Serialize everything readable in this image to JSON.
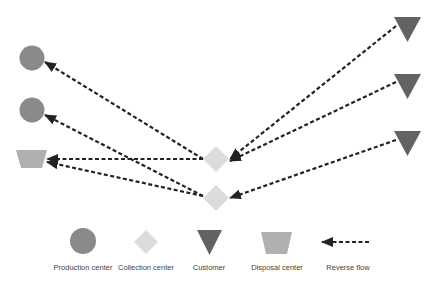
{
  "colors": {
    "production": "#8a8a8a",
    "collection": "#dcdcdc",
    "customer": "#636363",
    "disposal": "#b0b0b0",
    "flow": "#222222"
  },
  "nodes": {
    "production": [
      {
        "id": "P1"
      },
      {
        "id": "P2"
      }
    ],
    "collection": [
      {
        "id": "C1"
      },
      {
        "id": "C2"
      }
    ],
    "customer": [
      {
        "id": "K1"
      },
      {
        "id": "K2"
      },
      {
        "id": "K3"
      }
    ],
    "disposal": [
      {
        "id": "D1"
      }
    ]
  },
  "edges": [
    {
      "from": "K1",
      "to": "C1",
      "type": "reverse"
    },
    {
      "from": "K2",
      "to": "C1",
      "type": "reverse"
    },
    {
      "from": "K3",
      "to": "C2",
      "type": "reverse"
    },
    {
      "from": "C1",
      "to": "P1",
      "type": "reverse"
    },
    {
      "from": "C1",
      "to": "D1",
      "type": "reverse"
    },
    {
      "from": "C2",
      "to": "P2",
      "type": "reverse"
    },
    {
      "from": "C2",
      "to": "D1",
      "type": "reverse"
    }
  ],
  "legend": {
    "production": "Production center",
    "collection": "Collection center",
    "customer": "Customer",
    "disposal": "Disposal center",
    "flow": "Reverse flow"
  }
}
